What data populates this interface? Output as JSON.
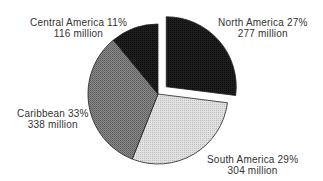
{
  "chart_data": {
    "type": "pie",
    "title": "",
    "categories": [
      "North America",
      "South America",
      "Caribbean",
      "Central America"
    ],
    "values": [
      27,
      29,
      33,
      11
    ],
    "population_millions": [
      277,
      304,
      338,
      116
    ],
    "unit": "%",
    "exploded": [
      "North America"
    ],
    "start_angle_deg": -90,
    "direction": "clockwise",
    "legend": "none (direct labels)",
    "slices": [
      {
        "name": "North America",
        "percent_label": "North America 27%",
        "value_label": "277 million",
        "fill": "#1a1a1a"
      },
      {
        "name": "South America",
        "percent_label": "South America 29%",
        "value_label": "304 million",
        "fill": "#d4d4d4"
      },
      {
        "name": "Caribbean",
        "percent_label": "Caribbean 33%",
        "value_label": "338 million",
        "fill": "#7a7a7a"
      },
      {
        "name": "Central America",
        "percent_label": "Central America 11%",
        "value_label": "116 million",
        "fill": "#161616"
      }
    ]
  }
}
